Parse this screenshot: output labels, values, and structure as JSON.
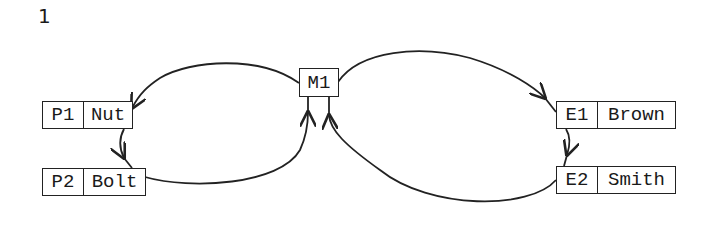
{
  "figure": {
    "number": "1"
  },
  "nodes": {
    "m1": {
      "id": "M1"
    },
    "p1": {
      "id": "P1",
      "label": "Nut"
    },
    "p2": {
      "id": "P2",
      "label": "Bolt"
    },
    "e1": {
      "id": "E1",
      "label": "Brown"
    },
    "e2": {
      "id": "E2",
      "label": "Smith"
    }
  },
  "edges": [
    {
      "from": "M1",
      "to": "P1"
    },
    {
      "from": "P1",
      "to": "P2"
    },
    {
      "from": "P2",
      "to": "M1"
    },
    {
      "from": "M1",
      "to": "E1"
    },
    {
      "from": "E1",
      "to": "E2"
    },
    {
      "from": "E2",
      "to": "M1"
    }
  ],
  "style": {
    "stroke": "#222222",
    "background": "#ffffff"
  }
}
